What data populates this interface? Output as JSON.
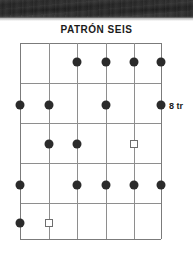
{
  "page": {
    "background_color": "#ffffff",
    "scan_band_color": "#232323"
  },
  "diagram": {
    "title": "PATRÓN SEIS",
    "fret_position_label": "8 tr",
    "instrument": "guitar",
    "strings": 6,
    "frets": 5,
    "marker_colors": {
      "filled_dot": "#2b2b2b",
      "open_square_stroke": "#6e6e6e",
      "grid_line": "#8e8e8e"
    },
    "grid": {
      "x_positions": [
        0,
        28.6,
        57.2,
        85.8,
        114.4,
        141
      ],
      "y_positions": [
        0,
        40,
        80,
        120,
        160,
        196
      ]
    },
    "markers": [
      {
        "string": 3,
        "fret": 1,
        "type": "dot",
        "x": 57.2,
        "y": 19
      },
      {
        "string": 4,
        "fret": 1,
        "type": "dot",
        "x": 85.8,
        "y": 19
      },
      {
        "string": 5,
        "fret": 1,
        "type": "dot",
        "x": 114.4,
        "y": 19
      },
      {
        "string": 6,
        "fret": 1,
        "type": "dot",
        "x": 141,
        "y": 19
      },
      {
        "string": 1,
        "fret": 2,
        "type": "dot",
        "x": 0,
        "y": 62
      },
      {
        "string": 2,
        "fret": 2,
        "type": "dot",
        "x": 28.6,
        "y": 62
      },
      {
        "string": 4,
        "fret": 2,
        "type": "dot",
        "x": 85.8,
        "y": 62
      },
      {
        "string": 6,
        "fret": 2,
        "type": "dot",
        "x": 141,
        "y": 62
      },
      {
        "string": 2,
        "fret": 3,
        "type": "dot",
        "x": 28.6,
        "y": 101
      },
      {
        "string": 3,
        "fret": 3,
        "type": "dot",
        "x": 57.2,
        "y": 101
      },
      {
        "string": 5,
        "fret": 3,
        "type": "square",
        "x": 114.4,
        "y": 101
      },
      {
        "string": 1,
        "fret": 4,
        "type": "dot",
        "x": 0,
        "y": 142
      },
      {
        "string": 3,
        "fret": 4,
        "type": "dot",
        "x": 57.2,
        "y": 142
      },
      {
        "string": 4,
        "fret": 4,
        "type": "dot",
        "x": 85.8,
        "y": 142
      },
      {
        "string": 5,
        "fret": 4,
        "type": "dot",
        "x": 114.4,
        "y": 142
      },
      {
        "string": 6,
        "fret": 4,
        "type": "dot",
        "x": 141,
        "y": 142
      },
      {
        "string": 1,
        "fret": 5,
        "type": "dot",
        "x": 0,
        "y": 180
      },
      {
        "string": 2,
        "fret": 5,
        "type": "square",
        "x": 28.6,
        "y": 180
      }
    ]
  }
}
